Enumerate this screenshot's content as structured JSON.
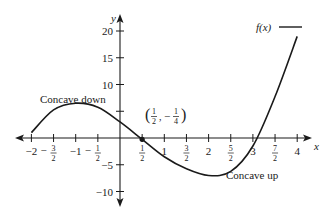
{
  "chart_data": {
    "type": "line",
    "title": "",
    "xlabel": "x",
    "ylabel": "y",
    "xlim": [
      -2,
      4
    ],
    "ylim": [
      -10,
      20
    ],
    "grid": false,
    "legend": {
      "position": "top-right",
      "entries": [
        "f(x)"
      ]
    },
    "x_ticks": [
      {
        "value": -2,
        "label": "−2"
      },
      {
        "value": -1.5,
        "label": "−3/2",
        "num": "3",
        "den": "2",
        "neg": true
      },
      {
        "value": -1,
        "label": "−1"
      },
      {
        "value": -0.5,
        "label": "−1/2",
        "num": "1",
        "den": "2",
        "neg": true
      },
      {
        "value": 0.5,
        "label": "1/2",
        "num": "1",
        "den": "2",
        "neg": false
      },
      {
        "value": 1,
        "label": "1"
      },
      {
        "value": 1.5,
        "label": "3/2",
        "num": "3",
        "den": "2",
        "neg": false
      },
      {
        "value": 2,
        "label": "2"
      },
      {
        "value": 2.5,
        "label": "5/2",
        "num": "5",
        "den": "2",
        "neg": false
      },
      {
        "value": 3,
        "label": "3"
      },
      {
        "value": 3.5,
        "label": "7/2",
        "num": "7",
        "den": "2",
        "neg": false
      },
      {
        "value": 4,
        "label": "4"
      }
    ],
    "y_ticks": [
      {
        "value": 20,
        "label": "20"
      },
      {
        "value": 15,
        "label": "15"
      },
      {
        "value": 10,
        "label": "10"
      },
      {
        "value": 5,
        "label": ""
      },
      {
        "value": -5,
        "label": "−5"
      },
      {
        "value": -10,
        "label": "−10"
      }
    ],
    "series": [
      {
        "name": "f(x)",
        "x": [
          -2,
          -1.5,
          -1,
          -0.5,
          0,
          0.5,
          1,
          1.5,
          2,
          2.5,
          3,
          3.5,
          4
        ],
        "values": [
          1,
          5.25,
          6.5,
          5.75,
          3,
          -0.25,
          -3.5,
          -5.75,
          -7,
          -6.25,
          -1.5,
          7.75,
          19
        ]
      }
    ],
    "annotations": [
      {
        "text": "Concave down",
        "x": -1,
        "y": 8
      },
      {
        "text": "Concave up",
        "x": 3,
        "y": -5
      },
      {
        "text": "(1/2, −1/4)",
        "x": 0.5,
        "y": -0.25,
        "marker": "point",
        "num_x": "1",
        "den_x": "2",
        "num_y": "1",
        "den_y": "4"
      }
    ]
  },
  "labels": {
    "y_axis": "y",
    "x_axis": "x",
    "legend": "f(x)",
    "concave_down": "Concave down",
    "concave_up": "Concave up",
    "point_x_num": "1",
    "point_x_den": "2",
    "point_y_num": "1",
    "point_y_den": "4",
    "point_minus": "−"
  }
}
